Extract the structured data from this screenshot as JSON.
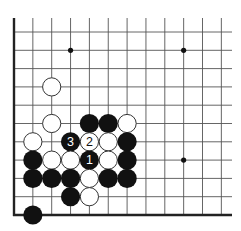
{
  "diagram": {
    "type": "go-board-fragment",
    "corner": "bottom-left",
    "grid": {
      "columns": 12,
      "rows": 11,
      "origin_x": 14,
      "origin_y": 32,
      "spacing_x": 18.85,
      "spacing_y": 18.3,
      "line_end_x": 232,
      "left_edge_top_y": 18,
      "line_color": "#555555",
      "edge_color": "#222222"
    },
    "star_points": [
      {
        "col": 3,
        "row": 1
      },
      {
        "col": 9,
        "row": 1
      },
      {
        "col": 9,
        "row": 7
      }
    ],
    "stones": [
      {
        "color": "white",
        "col": 2,
        "row": 3,
        "label": ""
      },
      {
        "color": "white",
        "col": 2,
        "row": 5,
        "label": ""
      },
      {
        "color": "black",
        "col": 4,
        "row": 5,
        "label": ""
      },
      {
        "color": "black",
        "col": 5,
        "row": 5,
        "label": ""
      },
      {
        "color": "white",
        "col": 6,
        "row": 5,
        "label": ""
      },
      {
        "color": "white",
        "col": 1,
        "row": 6,
        "label": ""
      },
      {
        "color": "black",
        "col": 3,
        "row": 6,
        "label": "3"
      },
      {
        "color": "white",
        "col": 4,
        "row": 6,
        "label": "2"
      },
      {
        "color": "white",
        "col": 5,
        "row": 6,
        "label": ""
      },
      {
        "color": "black",
        "col": 6,
        "row": 6,
        "label": ""
      },
      {
        "color": "black",
        "col": 1,
        "row": 7,
        "label": ""
      },
      {
        "color": "white",
        "col": 2,
        "row": 7,
        "label": ""
      },
      {
        "color": "white",
        "col": 3,
        "row": 7,
        "label": ""
      },
      {
        "color": "black",
        "col": 4,
        "row": 7,
        "label": "1"
      },
      {
        "color": "white",
        "col": 5,
        "row": 7,
        "label": ""
      },
      {
        "color": "black",
        "col": 6,
        "row": 7,
        "label": ""
      },
      {
        "color": "black",
        "col": 1,
        "row": 8,
        "label": ""
      },
      {
        "color": "black",
        "col": 2,
        "row": 8,
        "label": ""
      },
      {
        "color": "black",
        "col": 3,
        "row": 8,
        "label": ""
      },
      {
        "color": "white",
        "col": 4,
        "row": 8,
        "label": ""
      },
      {
        "color": "black",
        "col": 5,
        "row": 8,
        "label": ""
      },
      {
        "color": "black",
        "col": 6,
        "row": 8,
        "label": ""
      },
      {
        "color": "black",
        "col": 3,
        "row": 9,
        "label": ""
      },
      {
        "color": "white",
        "col": 4,
        "row": 9,
        "label": ""
      },
      {
        "color": "black",
        "col": 1,
        "row": 10,
        "label": ""
      }
    ],
    "move_labels": [
      "1",
      "2",
      "3"
    ],
    "colors": {
      "black_stone": "#111111",
      "white_stone": "#ffffff",
      "white_stone_outline": "#333333",
      "background": "#ffffff"
    }
  }
}
